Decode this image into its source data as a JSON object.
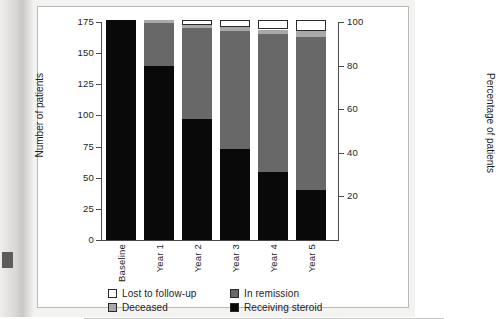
{
  "chart_data": {
    "type": "bar",
    "subtype": "stacked-bar",
    "title": "",
    "xlabel": "",
    "ylabel": "Number of patients",
    "ylabel_secondary": "Percentage of patients",
    "categories": [
      "Baseline",
      "Year 1",
      "Year 2",
      "Year 3",
      "Year 4",
      "Year 5"
    ],
    "ylim": [
      0,
      175
    ],
    "yticks": [
      0,
      25,
      50,
      75,
      100,
      125,
      150,
      175
    ],
    "ylim_secondary": [
      0,
      100
    ],
    "yticks_secondary": [
      20,
      40,
      60,
      80,
      100
    ],
    "grid": false,
    "legend_position": "bottom",
    "total_patients": 177,
    "series": [
      {
        "name": "Receiving steroid",
        "color": "#090909",
        "values": [
          177,
          140,
          97,
          73,
          55,
          40
        ]
      },
      {
        "name": "In remission",
        "color": "#686868",
        "values": [
          0,
          34,
          73,
          95,
          110,
          123
        ]
      },
      {
        "name": "Deceased",
        "color": "#a9a9a9",
        "values": [
          0,
          3,
          3,
          3,
          4,
          5
        ]
      },
      {
        "name": "Lost to follow-up",
        "color": "#ffffff",
        "values": [
          0,
          0,
          4,
          6,
          8,
          9
        ]
      }
    ]
  },
  "axes": {
    "left": {
      "label": "Number of patients",
      "ticks": [
        "175",
        "150",
        "125",
        "100",
        "75",
        "50",
        "25",
        "0"
      ]
    },
    "right": {
      "label": "Percentage of patients",
      "ticks": [
        "100",
        "80",
        "60",
        "40",
        "20"
      ]
    },
    "x": {
      "ticks": [
        "Baseline",
        "Year 1",
        "Year 2",
        "Year 3",
        "Year 4",
        "Year 5"
      ]
    }
  },
  "legend": {
    "items": [
      {
        "label": "Lost to follow-up",
        "swatch": "white"
      },
      {
        "label": "In remission",
        "swatch": "dgray"
      },
      {
        "label": "Deceased",
        "swatch": "lgray"
      },
      {
        "label": "Receiving steroid",
        "swatch": "black"
      }
    ]
  },
  "colors": {
    "receiving_steroid": "#090909",
    "in_remission": "#686868",
    "deceased": "#a9a9a9",
    "lost_to_follow_up": "#ffffff",
    "axis": "#4a4a4a",
    "text": "#1d1d1d"
  }
}
